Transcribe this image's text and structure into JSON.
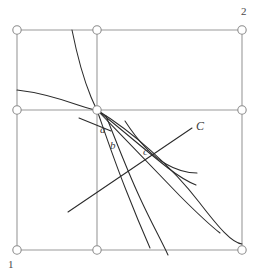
{
  "figure": {
    "type": "geometric-diagram",
    "background_color": "#ffffff",
    "grid_color": "#9a9a9a",
    "curve_color": "#2b2b2b",
    "node_fill": "#ffffff",
    "node_stroke": "#8c8c8c",
    "labels": {
      "corner_bottom_left": "1",
      "corner_top_right": "2",
      "curve_a": "a",
      "curve_b": "b",
      "curve_c": "c",
      "curve_C_upper": "C"
    },
    "grid": {
      "columns": 2,
      "rows": 2,
      "x_positions": [
        17,
        97,
        242
      ],
      "y_positions": [
        30,
        110,
        250
      ],
      "node_radius": 4.2,
      "node_count": 9
    },
    "curves": [
      {
        "name": "steep-declining-curve",
        "description": "steep curve from top entering near upper middle descending to the central node"
      },
      {
        "name": "flat-left-curve",
        "description": "shallow curve from left edge flattening toward the central node"
      },
      {
        "name": "short-tangent-a",
        "description": "short straight tangent segment near label a"
      },
      {
        "name": "indifference-curve-b",
        "description": "curve through label b descending to bottom right"
      },
      {
        "name": "indifference-curve-c",
        "description": "curve through label c descending to bottom right"
      },
      {
        "name": "offer-curve-C",
        "description": "rising curve toward the upper right labelled C"
      },
      {
        "name": "long-diagonal-line",
        "description": "long straight line from lower left toward upper right through the crossing region"
      },
      {
        "name": "outer-arc",
        "description": "wide arc from the central node sweeping to the bottom right corner"
      }
    ]
  }
}
